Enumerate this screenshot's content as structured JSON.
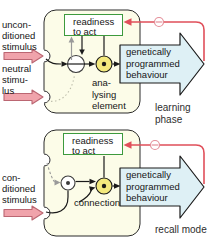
{
  "labels": {
    "unconditioned": [
      "uncon-",
      "ditioned",
      "stimulus"
    ],
    "neutral": [
      "neutral",
      "stimu-",
      "lus"
    ],
    "conditioned": [
      "con-",
      "ditioned",
      "stimulus"
    ],
    "readiness": [
      "readiness",
      "to act"
    ],
    "behaviour": [
      "genetically",
      "programmed",
      "behaviour"
    ],
    "analysing": [
      "ana-",
      "lysing",
      "element"
    ],
    "connection": "connection",
    "learning_phase": [
      "learning",
      "phase"
    ],
    "recall_mode": "recall mode"
  },
  "icons": {
    "inhibition": "minus-circle",
    "stimulus_arrow": "thick-right-arrow",
    "behaviour_arrow": "block-right-arrow"
  },
  "colors": {
    "panel_fill": "#fcfce8",
    "panel_stroke": "#2a2a2a",
    "pink_fill": "#f0a3ab",
    "pink_stroke": "#bb6672",
    "blue_fill": "#def0f5",
    "yellow_fill": "#f3e97d",
    "red": "#e04f5a",
    "green_border": "#3d9a3d",
    "gray": "#9a9a9a",
    "ink": "#161616"
  }
}
